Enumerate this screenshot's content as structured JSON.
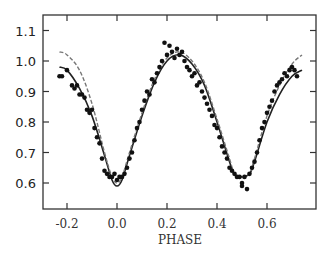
{
  "chart_data": {
    "type": "scatter",
    "title": "",
    "xlabel": "PHASE",
    "ylabel": "",
    "xlim": [
      -0.25,
      0.78
    ],
    "ylim": [
      0.52,
      1.15
    ],
    "x_ticks": [
      -0.2,
      0.0,
      0.2,
      0.4,
      0.6
    ],
    "x_tick_labels": [
      "-0.2",
      "0.0",
      "0.2",
      "0.4",
      "0.6"
    ],
    "y_ticks": [
      0.6,
      0.7,
      0.8,
      0.9,
      1.0,
      1.1
    ],
    "y_tick_labels": [
      "0.6",
      "0.7",
      "0.8",
      "0.9",
      "1.0",
      "1.1"
    ],
    "grid": false,
    "legend": null,
    "series": [
      {
        "name": "observations",
        "kind": "scatter",
        "x": [
          -0.23,
          -0.22,
          -0.2,
          -0.18,
          -0.17,
          -0.16,
          -0.15,
          -0.14,
          -0.13,
          -0.12,
          -0.11,
          -0.1,
          -0.09,
          -0.08,
          -0.07,
          -0.06,
          -0.05,
          -0.04,
          -0.03,
          -0.02,
          -0.01,
          0.0,
          0.01,
          0.02,
          0.03,
          0.04,
          0.05,
          0.06,
          0.07,
          0.08,
          0.09,
          0.1,
          0.11,
          0.12,
          0.13,
          0.14,
          0.15,
          0.16,
          0.17,
          0.18,
          0.19,
          0.2,
          0.21,
          0.22,
          0.23,
          0.24,
          0.25,
          0.26,
          0.27,
          0.28,
          0.29,
          0.3,
          0.31,
          0.32,
          0.33,
          0.34,
          0.35,
          0.36,
          0.37,
          0.38,
          0.39,
          0.4,
          0.41,
          0.42,
          0.43,
          0.44,
          0.45,
          0.46,
          0.47,
          0.48,
          0.49,
          0.5,
          0.5,
          0.51,
          0.52,
          0.53,
          0.54,
          0.55,
          0.56,
          0.57,
          0.58,
          0.59,
          0.6,
          0.61,
          0.62,
          0.63,
          0.64,
          0.65,
          0.66,
          0.67,
          0.68,
          0.69,
          0.7,
          0.71,
          0.72
        ],
        "y": [
          0.95,
          0.95,
          0.97,
          0.92,
          0.91,
          0.92,
          0.89,
          0.89,
          0.88,
          0.84,
          0.83,
          0.84,
          0.78,
          0.75,
          0.73,
          0.68,
          0.64,
          0.63,
          0.62,
          0.62,
          0.63,
          0.61,
          0.62,
          0.62,
          0.63,
          0.65,
          0.68,
          0.7,
          0.74,
          0.78,
          0.8,
          0.84,
          0.87,
          0.9,
          0.89,
          0.94,
          0.93,
          0.96,
          0.98,
          1.0,
          1.06,
          1.02,
          1.05,
          1.03,
          1.01,
          1.04,
          1.02,
          1.03,
          1.0,
          0.98,
          0.97,
          0.95,
          0.96,
          0.92,
          0.93,
          0.9,
          0.88,
          0.86,
          0.84,
          0.82,
          0.79,
          0.78,
          0.75,
          0.72,
          0.7,
          0.68,
          0.65,
          0.64,
          0.63,
          0.62,
          0.62,
          0.6,
          0.59,
          0.62,
          0.58,
          0.63,
          0.65,
          0.67,
          0.7,
          0.74,
          0.78,
          0.8,
          0.83,
          0.85,
          0.87,
          0.9,
          0.92,
          0.93,
          0.94,
          0.96,
          0.95,
          0.97,
          0.98,
          0.97,
          0.95
        ]
      },
      {
        "name": "model (solid)",
        "kind": "line",
        "style": "solid",
        "x": [
          -0.23,
          -0.2,
          -0.15,
          -0.1,
          -0.05,
          -0.02,
          0.0,
          0.02,
          0.05,
          0.1,
          0.15,
          0.2,
          0.25,
          0.3,
          0.35,
          0.4,
          0.45,
          0.47,
          0.5,
          0.53,
          0.55,
          0.6,
          0.65,
          0.7,
          0.74
        ],
        "y": [
          0.98,
          0.97,
          0.91,
          0.82,
          0.69,
          0.61,
          0.59,
          0.61,
          0.69,
          0.82,
          0.93,
          1.0,
          1.02,
          0.99,
          0.92,
          0.8,
          0.67,
          0.63,
          0.62,
          0.63,
          0.67,
          0.8,
          0.89,
          0.95,
          0.97
        ]
      },
      {
        "name": "model (dashed)",
        "kind": "line",
        "style": "dashed",
        "x": [
          -0.23,
          -0.2,
          -0.15,
          -0.1,
          -0.05,
          -0.02,
          0.0,
          0.02,
          0.05,
          0.1,
          0.15,
          0.2,
          0.25,
          0.3,
          0.35,
          0.4,
          0.45,
          0.47,
          0.5,
          0.53,
          0.55,
          0.6,
          0.65,
          0.7,
          0.74
        ],
        "y": [
          1.03,
          1.02,
          0.97,
          0.86,
          0.7,
          0.62,
          0.6,
          0.62,
          0.7,
          0.83,
          0.94,
          1.01,
          1.03,
          1.0,
          0.93,
          0.81,
          0.68,
          0.63,
          0.62,
          0.63,
          0.68,
          0.82,
          0.92,
          0.99,
          1.02
        ]
      }
    ]
  },
  "style": {
    "axis_color": "#333333",
    "point_color": "#111111",
    "solid_line_color": "#222222",
    "dashed_line_color": "#777777"
  }
}
